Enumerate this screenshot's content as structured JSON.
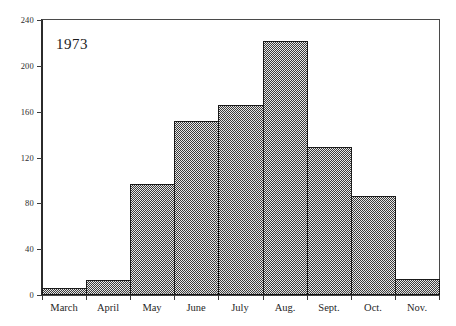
{
  "chart_data": {
    "type": "bar",
    "title": "",
    "subtitle": "",
    "annotation": "1973",
    "xlabel": "",
    "ylabel": "",
    "categories": [
      "March",
      "April",
      "May",
      "June",
      "July",
      "Aug.",
      "Sept.",
      "Oct.",
      "Nov."
    ],
    "values": [
      6,
      13,
      97,
      152,
      166,
      222,
      129,
      86,
      14
    ],
    "ylim": [
      0,
      240
    ],
    "ytick_labels": [
      "0",
      "40",
      "80",
      "120",
      "160",
      "200",
      "240"
    ],
    "ytick_values": [
      0,
      40,
      80,
      120,
      160,
      200,
      240
    ],
    "grid": false,
    "legend": null,
    "legend_position": "none",
    "bar_style": {
      "fill": "checkerboard-dither-gray",
      "fill_color": "#8c8c8c",
      "edge_color": "#1a1a1a",
      "gap": 0
    },
    "axis_color": "#3a3a3a",
    "background_color": "#ffffff"
  }
}
